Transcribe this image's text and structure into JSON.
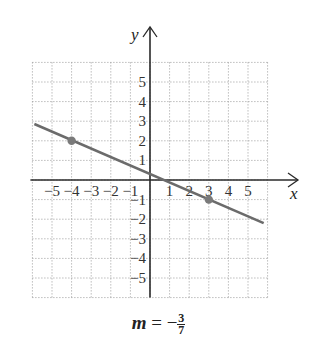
{
  "chart_data": {
    "type": "line",
    "title": "",
    "xlabel": "x",
    "ylabel": "y",
    "xlim": [
      -6,
      6
    ],
    "ylim": [
      -6,
      6
    ],
    "grid": true,
    "x_ticks": [
      -5,
      -4,
      -3,
      -2,
      -1,
      1,
      2,
      3,
      4,
      5
    ],
    "y_ticks": [
      -5,
      -4,
      -3,
      -2,
      -1,
      1,
      2,
      3,
      4,
      5
    ],
    "x_tick_labels": [
      "−5",
      "−4",
      "−3",
      "−2",
      "−1",
      "1",
      "2",
      "3",
      "4",
      "5"
    ],
    "y_tick_labels": [
      "5",
      "4",
      "3",
      "2",
      "1",
      "−1",
      "−2",
      "−3",
      "−4",
      "−5"
    ],
    "series": [
      {
        "name": "line",
        "x": [
          -5.9,
          5.8
        ],
        "y": [
          2.86,
          -2.2
        ],
        "color": "#6b6b6b"
      }
    ],
    "points": [
      {
        "x": -4,
        "y": 2
      },
      {
        "x": 3,
        "y": -1
      }
    ],
    "annotation": {
      "slope_label": "m",
      "equals": "=",
      "sign": "−",
      "numerator": "3",
      "denominator": "7"
    }
  },
  "colors": {
    "line": "#6b6b6b",
    "point": "#7a7a7a",
    "axis": "#2a2a2a",
    "grid": "#9a9a9a"
  }
}
